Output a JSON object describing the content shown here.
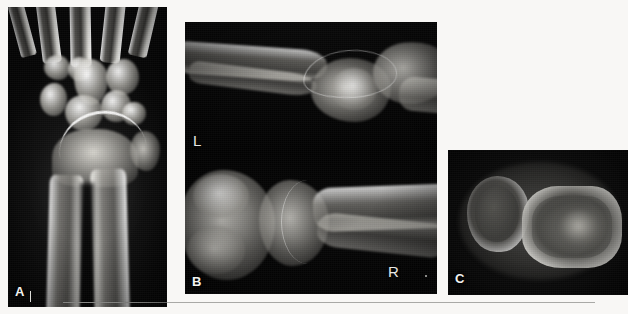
{
  "figure": {
    "background_color": "#f8f7f5",
    "rule_color": "#a9a9a6",
    "panel_count": 3
  },
  "panels": [
    {
      "id": "a",
      "label": "A",
      "modality": "radiograph",
      "view": "posteroanterior-wrist",
      "description": "PA radiograph of the wrist showing distal radius and ulna, carpal row and metacarpal bases",
      "background_color": "#060606",
      "bone_color": "#cfcdc6",
      "side_markers": []
    },
    {
      "id": "b",
      "label": "B",
      "modality": "radiograph",
      "view": "lateral-wrist-pair",
      "description": "Two lateral wrist radiographs stacked vertically with left and right side markers",
      "background_color": "#050505",
      "bone_color": "#c9c7c0",
      "side_markers": [
        {
          "text": "L",
          "position": "left-middle"
        },
        {
          "text": "R",
          "position": "lower-right"
        }
      ]
    },
    {
      "id": "c",
      "label": "C",
      "modality": "ct",
      "view": "axial-slice",
      "description": "Axial CT slice through the distal forearm showing two bone cross-sections with bright cortical rims",
      "background_color": "#050505",
      "bone_color": "#e8e6df",
      "side_markers": []
    }
  ],
  "annotations": {
    "tick_mark": "vertical-tick",
    "speck": "film-artifact-dot"
  }
}
